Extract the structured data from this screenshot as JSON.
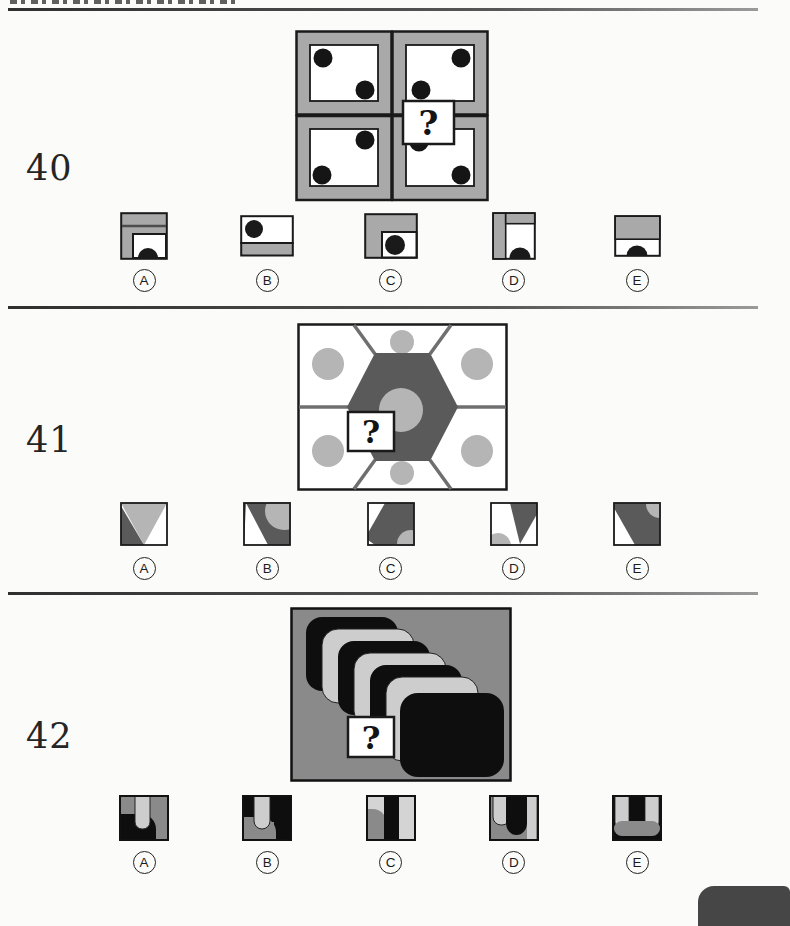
{
  "colors": {
    "frame_gray": "#a9a9a9",
    "hexagon_dark_gray": "#5a5a5a",
    "circle_light_gray": "#b5b5b5",
    "panel_gray": "#8a8a8a",
    "card_light_gray": "#cdcdcd",
    "ink_black": "#111111",
    "corner_tab_gray": "#464646"
  },
  "questions": [
    {
      "number": "40",
      "figure": "grid-of-four-dot-cards",
      "question_mark": "?",
      "options": [
        {
          "letter": "A"
        },
        {
          "letter": "B"
        },
        {
          "letter": "C"
        },
        {
          "letter": "D"
        },
        {
          "letter": "E"
        }
      ]
    },
    {
      "number": "41",
      "figure": "hexagon-with-gray-circles",
      "question_mark": "?",
      "options": [
        {
          "letter": "A"
        },
        {
          "letter": "B"
        },
        {
          "letter": "C"
        },
        {
          "letter": "D"
        },
        {
          "letter": "E"
        }
      ]
    },
    {
      "number": "42",
      "figure": "cascade-of-rounded-cards",
      "question_mark": "?",
      "options": [
        {
          "letter": "A"
        },
        {
          "letter": "B"
        },
        {
          "letter": "C"
        },
        {
          "letter": "D"
        },
        {
          "letter": "E"
        }
      ]
    }
  ]
}
